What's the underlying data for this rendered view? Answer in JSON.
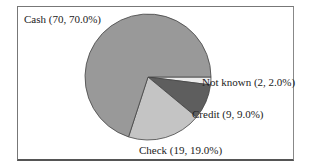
{
  "chart_data": {
    "type": "pie",
    "title": "",
    "categories": [
      "Cash",
      "Check",
      "Credit",
      "Not known"
    ],
    "values": [
      70,
      19,
      9,
      2
    ],
    "percentages": [
      70.0,
      19.0,
      9.0,
      2.0
    ],
    "colors": [
      "#999999",
      "#c4c4c4",
      "#5e5e5e",
      "#ececec"
    ],
    "labels": [
      "Cash (70, 70.0%)",
      "Check (19, 19.0%)",
      "Credit (9, 9.0%)",
      "Not known (2, 2.0%)"
    ],
    "start_angle_deg": 0,
    "direction": "clockwise",
    "legend": "none (inline slice labels)"
  },
  "labels": {
    "cash": "Cash (70, 70.0%)",
    "check": "Check (19, 19.0%)",
    "credit": "Credit (9, 9.0%)",
    "not_known": "Not known (2, 2.0%)"
  }
}
